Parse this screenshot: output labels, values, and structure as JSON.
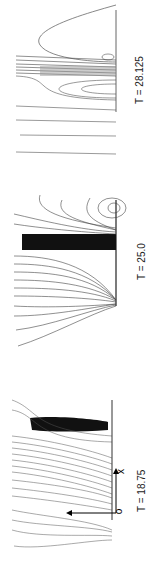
{
  "figure": {
    "panels": [
      {
        "id": "p1",
        "label": "T = 28.125"
      },
      {
        "id": "p2",
        "label": "T = 25.0"
      },
      {
        "id": "p3",
        "label": "T = 18.75"
      }
    ],
    "axes": {
      "origin_label": "o",
      "x_label": "x"
    },
    "line_color": "#333333"
  }
}
